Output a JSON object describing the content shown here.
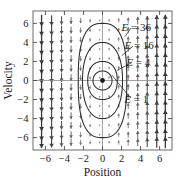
{
  "chart_data": {
    "type": "line",
    "title": "",
    "xlabel": "Position",
    "ylabel": "Velocity",
    "xlim": [
      -7.3,
      7.3
    ],
    "ylim": [
      -7.3,
      7.3
    ],
    "xticks": [
      "-6",
      "-4",
      "-2",
      "0",
      "2",
      "4",
      "6"
    ],
    "xtick_values": [
      -6,
      -4,
      -2,
      0,
      2,
      4,
      6
    ],
    "yticks": [
      "6",
      "4",
      "2",
      "0",
      "-2",
      "-4",
      "-6"
    ],
    "ytick_values": [
      6,
      4,
      2,
      0,
      -2,
      -4,
      -6
    ],
    "grid": false,
    "legend": "none",
    "equilibrium_point": {
      "x": 0,
      "y": 0,
      "label": "center"
    },
    "series": [
      {
        "name": "E = 1",
        "label": "E = 1",
        "type": "closed-orbit",
        "semi_axis_x": 1.0,
        "semi_axis_y": 1.0,
        "label_x": 3.55,
        "label_y": -1.95,
        "leader_from_x": 1.0,
        "leader_from_y": 0.55,
        "leader_to_x": 2.95,
        "leader_to_y": -1.85
      },
      {
        "name": "E = 4",
        "label": "E = 4",
        "type": "closed-orbit",
        "semi_axis_x": 1.55,
        "semi_axis_y": 2.0,
        "label_x": 3.75,
        "label_y": 1.95,
        "leader_from_x": 1.52,
        "leader_from_y": 1.05,
        "leader_to_x": 3.1,
        "leader_to_y": 1.9
      },
      {
        "name": "E = 16",
        "label": "E = 16",
        "type": "closed-orbit",
        "semi_axis_x": 2.1,
        "semi_axis_y": 4.0,
        "label_x": 3.85,
        "label_y": 3.65,
        "leader_from_x": 2.02,
        "leader_from_y": 2.6,
        "leader_to_x": 3.2,
        "leader_to_y": 3.6
      },
      {
        "name": "E = 36",
        "label": "E = 36",
        "type": "closed-orbit",
        "semi_axis_x": 2.55,
        "semi_axis_y": 6.0,
        "label_x": 3.55,
        "label_y": 5.6,
        "leader_from_x": 2.35,
        "leader_from_y": 4.6,
        "leader_to_x": 3.0,
        "leader_to_y": 5.5
      }
    ],
    "vector_field": {
      "description": "Arrows point upward for x<0 and downward for x>0; magnitude grows with distance from the origin",
      "x_samples": [
        -6.4,
        -5.35,
        -4.3,
        -3.3,
        -2.3,
        -1.3,
        -0.3,
        0.7,
        1.7,
        2.7,
        3.7,
        4.7,
        5.7,
        6.6
      ],
      "y_samples": [
        6.3,
        5.3,
        4.3,
        3.3,
        2.3,
        1.3,
        0.3,
        -0.7,
        -1.7,
        -2.7,
        -3.7,
        -4.7,
        -5.7,
        -6.5
      ]
    }
  },
  "axis": {
    "x_label": "Position",
    "y_label": "Velocity"
  },
  "icons": {
    "equilibrium_dot": "center-dot-icon",
    "field_arrow": "vector-arrow-icon"
  }
}
